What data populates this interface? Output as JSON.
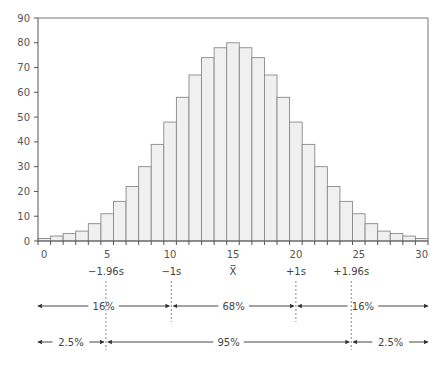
{
  "chart_data": {
    "type": "bar",
    "title": "",
    "xlabel": "",
    "ylabel": "",
    "categories": [
      0,
      1,
      2,
      3,
      4,
      5,
      6,
      7,
      8,
      9,
      10,
      11,
      12,
      13,
      14,
      15,
      16,
      17,
      18,
      19,
      20,
      21,
      22,
      23,
      24,
      25,
      26,
      27,
      28,
      29,
      30
    ],
    "values": [
      1,
      2,
      3,
      4,
      7,
      11,
      16,
      22,
      30,
      39,
      48,
      58,
      67,
      74,
      78,
      80,
      78,
      74,
      67,
      58,
      48,
      39,
      30,
      22,
      16,
      11,
      7,
      4,
      3,
      2,
      1
    ],
    "ylim": [
      0,
      90
    ],
    "xlim": [
      0,
      30
    ],
    "yticks": [
      0,
      10,
      20,
      30,
      40,
      50,
      60,
      70,
      80,
      90
    ],
    "xticks": [
      0,
      5,
      10,
      15,
      20,
      25,
      30
    ],
    "grid": false,
    "legend": null,
    "bar_fill": "#f0f0f0",
    "bar_stroke": "#8a8a8a",
    "annotations": {
      "markers": [
        {
          "label": "−1.96s",
          "x": 4.9
        },
        {
          "label": "−1s",
          "x": 10.1
        },
        {
          "label": "X̅",
          "x": 15
        },
        {
          "label": "+1s",
          "x": 20
        },
        {
          "label": "+1.96s",
          "x": 24.4
        }
      ],
      "ranges_row1": [
        {
          "label": "16%",
          "from": "left",
          "to": "−1s"
        },
        {
          "label": "68%",
          "from": "−1s",
          "to": "+1s"
        },
        {
          "label": "16%",
          "from": "+1s",
          "to": "right"
        }
      ],
      "ranges_row2": [
        {
          "label": "2.5%",
          "from": "left",
          "to": "−1.96s"
        },
        {
          "label": "95%",
          "from": "−1.96s",
          "to": "+1.96s"
        },
        {
          "label": "2.5%",
          "from": "+1.96s",
          "to": "right"
        }
      ]
    }
  }
}
